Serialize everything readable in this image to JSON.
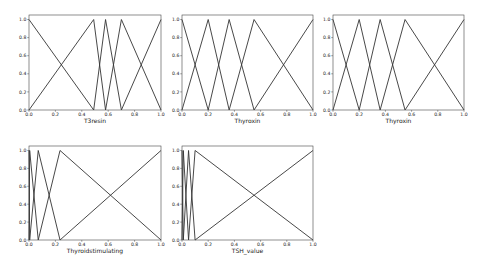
{
  "figure": {
    "width": 484,
    "height": 269,
    "background": "#ffffff",
    "line_color": "#333333",
    "axes_color": "#444444"
  },
  "chart_data": [
    {
      "type": "line",
      "title": "",
      "xlabel": "T3resin",
      "ylabel": "",
      "xlim": [
        0,
        1
      ],
      "ylim": [
        0,
        1.05
      ],
      "xticks": [
        "0.0",
        "0.2",
        "0.4",
        "0.6",
        "0.8",
        "1.0"
      ],
      "yticks": [
        "0.0",
        "0.2",
        "0.4",
        "0.6",
        "0.8",
        "1.0"
      ],
      "grid": false,
      "frame": {
        "x0": 29,
        "y0": 15,
        "x1": 161,
        "y1": 110
      },
      "series": [
        {
          "name": "mf1",
          "x": [
            0,
            0,
            0.49
          ],
          "y": [
            1,
            1,
            0
          ]
        },
        {
          "name": "mf2",
          "x": [
            0,
            0.49,
            0.58
          ],
          "y": [
            0,
            1,
            0
          ]
        },
        {
          "name": "mf3",
          "x": [
            0.49,
            0.58,
            0.7
          ],
          "y": [
            0,
            1,
            0
          ]
        },
        {
          "name": "mf4",
          "x": [
            0.58,
            0.7,
            1.0
          ],
          "y": [
            0,
            1,
            0
          ]
        },
        {
          "name": "mf5",
          "x": [
            0.7,
            1.0,
            1.0
          ],
          "y": [
            0,
            1,
            1
          ]
        }
      ]
    },
    {
      "type": "line",
      "title": "",
      "xlabel": "Thyroxin",
      "ylabel": "",
      "xlim": [
        0,
        1
      ],
      "ylim": [
        0,
        1.05
      ],
      "xticks": [
        "0.0",
        "0.2",
        "0.4",
        "0.6",
        "0.8",
        "1.0"
      ],
      "yticks": [
        "0.0",
        "0.2",
        "0.4",
        "0.6",
        "0.8",
        "1.0"
      ],
      "grid": false,
      "frame": {
        "x0": 182,
        "y0": 15,
        "x1": 313,
        "y1": 110
      },
      "series": [
        {
          "name": "mf1",
          "x": [
            0,
            0,
            0.2
          ],
          "y": [
            1,
            1,
            0
          ]
        },
        {
          "name": "mf2",
          "x": [
            0,
            0.2,
            0.36
          ],
          "y": [
            0,
            1,
            0
          ]
        },
        {
          "name": "mf3",
          "x": [
            0.2,
            0.36,
            0.55
          ],
          "y": [
            0,
            1,
            0
          ]
        },
        {
          "name": "mf4",
          "x": [
            0.36,
            0.55,
            1.0
          ],
          "y": [
            0,
            1,
            0
          ]
        },
        {
          "name": "mf5",
          "x": [
            0.55,
            1.0,
            1.0
          ],
          "y": [
            0,
            1,
            1
          ]
        }
      ]
    },
    {
      "type": "line",
      "title": "",
      "xlabel": "Thyroxin",
      "ylabel": "",
      "xlim": [
        0,
        1
      ],
      "ylim": [
        0,
        1.05
      ],
      "xticks": [
        "0.0",
        "0.2",
        "0.4",
        "0.6",
        "0.8",
        "1.0"
      ],
      "yticks": [
        "0.0",
        "0.2",
        "0.4",
        "0.6",
        "0.8",
        "1.0"
      ],
      "grid": false,
      "frame": {
        "x0": 333,
        "y0": 15,
        "x1": 464,
        "y1": 110
      },
      "series": [
        {
          "name": "mf1",
          "x": [
            0,
            0,
            0.2
          ],
          "y": [
            1,
            1,
            0
          ]
        },
        {
          "name": "mf2",
          "x": [
            0,
            0.2,
            0.36
          ],
          "y": [
            0,
            1,
            0
          ]
        },
        {
          "name": "mf3",
          "x": [
            0.2,
            0.36,
            0.55
          ],
          "y": [
            0,
            1,
            0
          ]
        },
        {
          "name": "mf4",
          "x": [
            0.36,
            0.55,
            1.0
          ],
          "y": [
            0,
            1,
            0
          ]
        },
        {
          "name": "mf5",
          "x": [
            0.55,
            1.0,
            1.0
          ],
          "y": [
            0,
            1,
            1
          ]
        }
      ]
    },
    {
      "type": "line",
      "title": "",
      "xlabel": "Thyroidstimulating",
      "ylabel": "",
      "xlim": [
        0,
        1
      ],
      "ylim": [
        0,
        1.05
      ],
      "xticks": [
        "0.0",
        "0.2",
        "0.4",
        "0.6",
        "0.8",
        "1.0"
      ],
      "yticks": [
        "0.0",
        "0.2",
        "0.4",
        "0.6",
        "0.8",
        "1.0"
      ],
      "grid": false,
      "frame": {
        "x0": 29,
        "y0": 146,
        "x1": 161,
        "y1": 240
      },
      "series": [
        {
          "name": "mf1",
          "x": [
            0,
            0,
            0.005
          ],
          "y": [
            1,
            1,
            0
          ]
        },
        {
          "name": "mf2",
          "x": [
            0,
            0.005,
            0.07
          ],
          "y": [
            0,
            1,
            0
          ]
        },
        {
          "name": "mf3",
          "x": [
            0.005,
            0.07,
            0.235
          ],
          "y": [
            0,
            1,
            0
          ]
        },
        {
          "name": "mf4",
          "x": [
            0.07,
            0.235,
            1.0
          ],
          "y": [
            0,
            1,
            0
          ]
        },
        {
          "name": "mf5",
          "x": [
            0.235,
            1.0,
            1.0
          ],
          "y": [
            0,
            1,
            1
          ]
        }
      ]
    },
    {
      "type": "line",
      "title": "",
      "xlabel": "TSH_value",
      "ylabel": "",
      "xlim": [
        0,
        1
      ],
      "ylim": [
        0,
        1.05
      ],
      "xticks": [
        "0.0",
        "0.2",
        "0.4",
        "0.6",
        "0.8",
        "1.0"
      ],
      "yticks": [
        "0.0",
        "0.2",
        "0.4",
        "0.6",
        "0.8",
        "1.0"
      ],
      "grid": false,
      "frame": {
        "x0": 182,
        "y0": 146,
        "x1": 313,
        "y1": 240
      },
      "series": [
        {
          "name": "mf1",
          "x": [
            0,
            0,
            0.01
          ],
          "y": [
            1,
            1,
            0
          ]
        },
        {
          "name": "mf2",
          "x": [
            0,
            0.01,
            0.05
          ],
          "y": [
            0,
            1,
            0
          ]
        },
        {
          "name": "mf3",
          "x": [
            0.01,
            0.05,
            0.1
          ],
          "y": [
            0,
            1,
            0
          ]
        },
        {
          "name": "mf4",
          "x": [
            0.05,
            0.1,
            1.0
          ],
          "y": [
            0,
            1,
            0
          ]
        },
        {
          "name": "mf5",
          "x": [
            0.1,
            1.0,
            1.0
          ],
          "y": [
            0,
            1,
            1
          ]
        }
      ]
    }
  ]
}
